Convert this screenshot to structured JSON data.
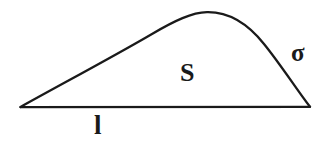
{
  "figure": {
    "kind": "geometric-diagram",
    "background_color": "#ffffff",
    "stroke_color": "#1a1a1a",
    "labels": {
      "area": "S",
      "curve": "σ",
      "base": "l"
    },
    "label_meanings": {
      "area": "enclosed area S",
      "curve": "boundary curve sigma",
      "base": "base segment length l"
    },
    "geometry": {
      "left_vertex": "20,107",
      "right_vertex": "310,107",
      "apex": "205,12",
      "baseline_y": "107",
      "stroke_width": "2.2"
    }
  }
}
